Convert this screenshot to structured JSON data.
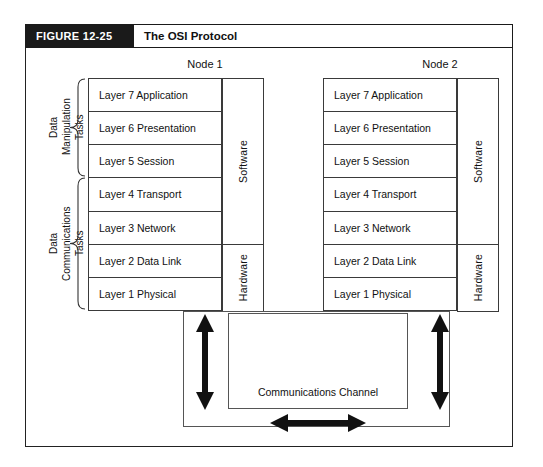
{
  "figure": {
    "number": "FIGURE 12-25",
    "title": "The OSI Protocol"
  },
  "colors": {
    "header_bar": "#1a1a1a",
    "header_text": "#ffffff",
    "frame_border": "#222222",
    "box_border": "#3a3a3a",
    "arrow_fill": "#111111",
    "background": "#ffffff"
  },
  "task_groups": [
    {
      "id": "data-manipulation",
      "label": "Data\nManipulation\nTasks",
      "covers_layers": [
        "Layer 7 Application",
        "Layer 6 Presentation",
        "Layer 5 Session"
      ]
    },
    {
      "id": "data-communications",
      "label": "Data\nCommunications\nTasks",
      "covers_layers": [
        "Layer 4 Transport",
        "Layer 3 Network",
        "Layer 2 Data Link",
        "Layer 1 Physical"
      ]
    }
  ],
  "nodes": [
    {
      "id": "node-1",
      "title": "Node 1",
      "layers": [
        "Layer 7 Application",
        "Layer 6 Presentation",
        "Layer 5 Session",
        "Layer 4 Transport",
        "Layer 3 Network",
        "Layer 2 Data Link",
        "Layer 1 Physical"
      ],
      "implementation": {
        "software": "Software",
        "hardware": "Hardware"
      }
    },
    {
      "id": "node-2",
      "title": "Node 2",
      "layers": [
        "Layer 7 Application",
        "Layer 6 Presentation",
        "Layer 5 Session",
        "Layer 4 Transport",
        "Layer 3 Network",
        "Layer 2 Data Link",
        "Layer 1 Physical"
      ],
      "implementation": {
        "software": "Software",
        "hardware": "Hardware"
      }
    }
  ],
  "channel": {
    "label": "Communications Channel"
  },
  "arrows": [
    {
      "id": "node1-channel-arrow",
      "orientation": "vertical",
      "heads": "double"
    },
    {
      "id": "node2-channel-arrow",
      "orientation": "vertical",
      "heads": "double"
    },
    {
      "id": "channel-transmission-arrow",
      "orientation": "horizontal",
      "heads": "double"
    }
  ]
}
